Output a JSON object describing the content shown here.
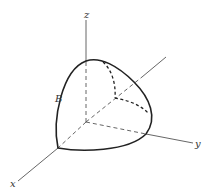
{
  "diagram": {
    "labels": {
      "z_axis": "z",
      "x_axis": "x",
      "y_axis": "y",
      "region": "B"
    },
    "colors": {
      "axis": "#555555",
      "outline": "#222222",
      "background": "#ffffff"
    }
  }
}
